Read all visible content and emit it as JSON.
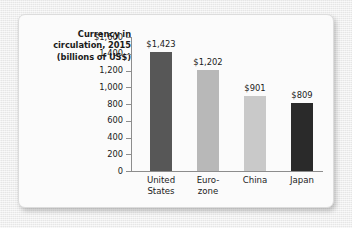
{
  "figure": {
    "title_lines": [
      "Currency in",
      "circulation, 2015",
      "(billions of US$)"
    ]
  },
  "chart_data": {
    "type": "bar",
    "title": "Currency in circulation, 2015 (billions of US$)",
    "xlabel": "",
    "ylabel": "",
    "ylim": [
      0,
      1600
    ],
    "grid": false,
    "legend": "none",
    "y_ticks": [
      0,
      200,
      400,
      600,
      800,
      1000,
      1200,
      1400,
      1600
    ],
    "y_tick_labels": [
      "0",
      "200",
      "400",
      "600",
      "800",
      "1,000",
      "1,200",
      "1,400",
      "$1,600"
    ],
    "categories": [
      "United States",
      "Euro-zone",
      "China",
      "Japan"
    ],
    "category_lines": [
      [
        "United",
        "States"
      ],
      [
        "Euro-",
        "zone"
      ],
      [
        "China",
        ""
      ],
      [
        "Japan",
        ""
      ]
    ],
    "values": [
      1423,
      1202,
      901,
      809
    ],
    "value_labels": [
      "$1,423",
      "$1,202",
      "$901",
      "$809"
    ],
    "bar_colors": [
      "#575757",
      "#b8b8b8",
      "#c9c9c9",
      "#2a2a2a"
    ],
    "axis_color": "#8d8d8d",
    "card_color": "#fbfbfb",
    "background_color": "#ededed"
  }
}
